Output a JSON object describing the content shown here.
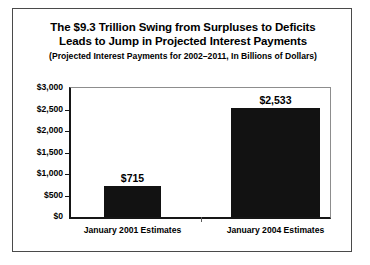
{
  "chart_data": {
    "type": "bar",
    "title": "The $9.3 Trillion Swing from Surpluses to Deficits Leads to Jump in Projected Interest Payments",
    "title_lines": [
      "The $9.3 Trillion Swing from Surpluses to Deficits",
      "Leads to Jump in Projected Interest Payments"
    ],
    "subtitle": "(Projected Interest Payments for 2002–2011, In Billions of Dollars)",
    "categories": [
      "January 2001 Estimates",
      "January 2004 Estimates"
    ],
    "values": [
      715,
      2533
    ],
    "value_labels": [
      "$715",
      "$2,533"
    ],
    "xlabel": "",
    "ylabel": "",
    "ylim": [
      0,
      3000
    ],
    "ytick_values": [
      0,
      500,
      1000,
      1500,
      2000,
      2500,
      3000
    ],
    "ytick_labels": [
      "$0",
      "$500",
      "$1,000",
      "$1,500",
      "$2,000",
      "$2,500",
      "$3,000"
    ],
    "grid": false,
    "legend": false,
    "bar_color": "#121212",
    "axis_color": "#161616",
    "background_color": "#ffffff",
    "border_color": "#4a4a4a"
  }
}
